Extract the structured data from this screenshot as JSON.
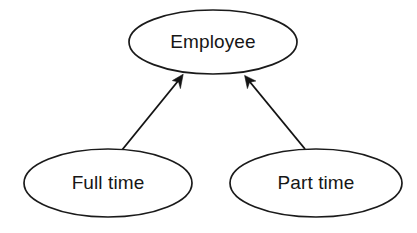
{
  "diagram": {
    "type": "er-generalization",
    "background_color": "#ffffff",
    "stroke_color": "#141414",
    "text_color": "#161616",
    "nodes": [
      {
        "id": "employee",
        "label": "Employee",
        "shape": "ellipse",
        "role": "supertype",
        "cx": 213,
        "cy": 42,
        "rx": 84,
        "ry": 32
      },
      {
        "id": "full-time",
        "label": "Full time",
        "shape": "ellipse",
        "role": "subtype",
        "cx": 108,
        "cy": 183,
        "rx": 84,
        "ry": 34
      },
      {
        "id": "part-time",
        "label": "Part time",
        "shape": "ellipse",
        "role": "subtype",
        "cx": 316,
        "cy": 183,
        "rx": 86,
        "ry": 34
      }
    ],
    "edges": [
      {
        "id": "full-time-to-employee",
        "from": "full-time",
        "to": "employee",
        "arrow": "open-triangle-filled",
        "x1": 122,
        "y1": 150,
        "x2": 183,
        "y2": 75
      },
      {
        "id": "part-time-to-employee",
        "from": "part-time",
        "to": "employee",
        "arrow": "open-triangle-filled",
        "x1": 305,
        "y1": 149,
        "x2": 245,
        "y2": 76
      }
    ]
  }
}
